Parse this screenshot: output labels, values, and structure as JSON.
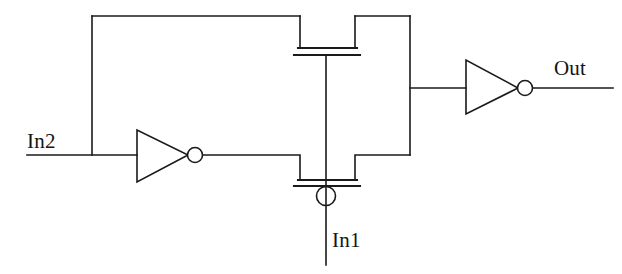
{
  "diagram": {
    "kind": "cmos-transistor-level-schematic",
    "title": "",
    "stroke_color": "#1a1a1a",
    "background_color": "#ffffff",
    "stroke_width": 1.6,
    "labels": {
      "in2": "In2",
      "in1": "In1",
      "out": "Out"
    },
    "components": [
      {
        "name": "inverter-left",
        "type": "inverter",
        "input_net": "In2",
        "output_net": "nmos-drain-branch"
      },
      {
        "name": "inverter-right",
        "type": "inverter",
        "input_net": "internal-node",
        "output_net": "Out"
      },
      {
        "name": "pmos-transistor",
        "type": "mosfet",
        "polarity": "p-channel",
        "gate_net": "In1",
        "has_gate_bubble": false
      },
      {
        "name": "nmos-transistor",
        "type": "mosfet",
        "polarity": "n-channel",
        "gate_net": "In1",
        "has_gate_bubble": true
      }
    ],
    "nets": [
      "In1",
      "In2",
      "Out",
      "supply-rail",
      "internal-node"
    ]
  },
  "geometry": {
    "supply_rail_y": 16,
    "left_rail_x": 92,
    "right_rail_x": 410,
    "in2_wire_y": 155,
    "output_branch_y": 88,
    "pmos_channel_y": 48,
    "pmos_gate_bar_y": 55,
    "nmos_channel_y": 180,
    "nmos_gate_bar_y": 186,
    "gate_column_x": 326,
    "device_left_x": 300,
    "device_right_x": 355,
    "in1_line_bottom_y": 265,
    "out_wire_end_x": 613
  }
}
